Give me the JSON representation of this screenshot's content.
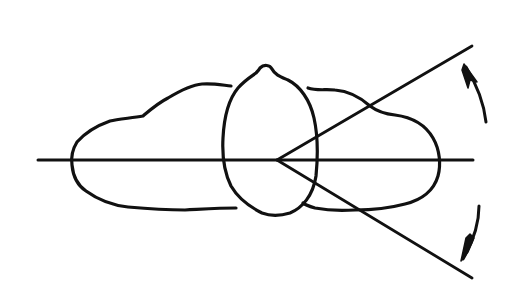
{
  "diagram": {
    "description": "Hand-drawn polar/radiation pattern sketch: three lobes along a horizontal axis with an angular sector and two rotation arrows",
    "colors": {
      "background": "#ffffff",
      "ink": "#111111"
    },
    "elements": {
      "axis": "horizontal-axis",
      "lobes": [
        "left-lobe",
        "center-lobe",
        "right-lobe"
      ],
      "rays": [
        "upper-ray",
        "lower-ray"
      ],
      "arrows": [
        "upper-rotation-arrow",
        "lower-rotation-arrow"
      ]
    }
  }
}
